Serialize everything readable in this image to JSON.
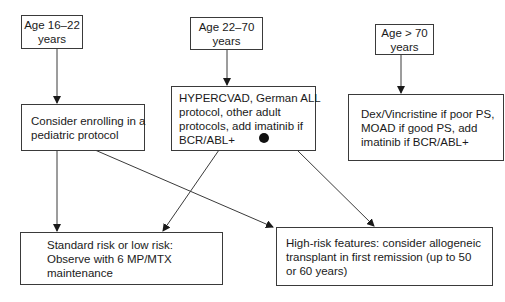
{
  "diagram": {
    "type": "flowchart",
    "colors": {
      "stroke": "#3a3a3a",
      "background": "#ffffff",
      "text": "#1a1a1a"
    },
    "nodes": {
      "age_16_22": {
        "lines": [
          "Age 16–22",
          "years"
        ]
      },
      "age_22_70": {
        "lines": [
          "Age 22–70",
          "years"
        ]
      },
      "age_over_70": {
        "lines": [
          "Age > 70",
          "years"
        ]
      },
      "pediatric": {
        "lines": [
          "Consider enrolling in a",
          "pediatric protocol"
        ]
      },
      "hypercvad": {
        "lines": [
          "HYPERCVAD, German ALL",
          "protocol, other adult",
          "protocols, add imatinib if",
          "BCR/ABL+"
        ]
      },
      "dex_vincristine": {
        "lines": [
          "Dex/Vincristine if poor PS,",
          "MOAD if good PS, add",
          "imatinib if BCR/ABL+"
        ]
      },
      "standard_risk": {
        "lines": [
          "Standard risk or low risk:",
          "Observe with 6 MP/MTX",
          "maintenance"
        ]
      },
      "high_risk": {
        "lines": [
          "High-risk features: consider allogeneic",
          "transplant in first remission (up to 50",
          "or 60 years)"
        ]
      }
    },
    "edges": [
      {
        "from": "age_16_22",
        "to": "pediatric"
      },
      {
        "from": "age_22_70",
        "to": "hypercvad"
      },
      {
        "from": "age_over_70",
        "to": "dex_vincristine"
      },
      {
        "from": "pediatric",
        "to": "standard_risk"
      },
      {
        "from": "pediatric",
        "to": "high_risk"
      },
      {
        "from": "hypercvad",
        "to": "standard_risk"
      },
      {
        "from": "hypercvad",
        "to": "high_risk"
      }
    ]
  }
}
